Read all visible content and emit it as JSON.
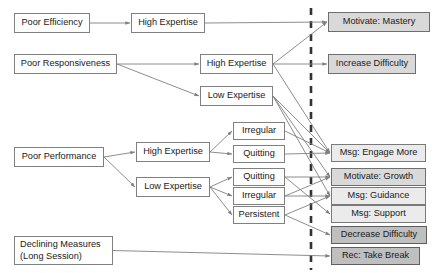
{
  "diagram": {
    "divider": {
      "name": "dashed-separator",
      "x": 311,
      "style": "dashed"
    },
    "nodes": [
      {
        "id": "poor-efficiency",
        "label": "Poor Efficiency",
        "x": 14,
        "y": 13,
        "w": 76,
        "h": 20,
        "fill": "white",
        "column": "condition"
      },
      {
        "id": "eff-high-expertise",
        "label": "High Expertise",
        "x": 131,
        "y": 13,
        "w": 74,
        "h": 20,
        "fill": "white",
        "column": "state"
      },
      {
        "id": "motivate-mastery",
        "label": "Motivate: Mastery",
        "x": 328,
        "y": 12,
        "w": 102,
        "h": 20,
        "fill": "mid",
        "column": "action"
      },
      {
        "id": "poor-responsiveness",
        "label": "Poor Responsiveness",
        "x": 14,
        "y": 54,
        "w": 103,
        "h": 20,
        "fill": "white",
        "column": "condition"
      },
      {
        "id": "resp-high-expertise",
        "label": "High Expertise",
        "x": 200,
        "y": 54,
        "w": 73,
        "h": 20,
        "fill": "white",
        "column": "state"
      },
      {
        "id": "resp-low-expertise",
        "label": "Low Expertise",
        "x": 200,
        "y": 86,
        "w": 73,
        "h": 20,
        "fill": "white",
        "column": "state"
      },
      {
        "id": "increase-difficulty",
        "label": "Increase Difficulty",
        "x": 328,
        "y": 54,
        "w": 88,
        "h": 20,
        "fill": "mid",
        "column": "action"
      },
      {
        "id": "poor-performance",
        "label": "Poor Performance",
        "x": 14,
        "y": 147,
        "w": 90,
        "h": 20,
        "fill": "white",
        "column": "condition"
      },
      {
        "id": "perf-high-expertise",
        "label": "High Expertise",
        "x": 136,
        "y": 142,
        "w": 74,
        "h": 20,
        "fill": "white",
        "column": "state"
      },
      {
        "id": "perf-low-expertise",
        "label": "Low Expertise",
        "x": 136,
        "y": 177,
        "w": 74,
        "h": 20,
        "fill": "white",
        "column": "state"
      },
      {
        "id": "hi-irregular",
        "label": "Irregular",
        "x": 233,
        "y": 122,
        "w": 52,
        "h": 18,
        "fill": "white",
        "column": "behavior"
      },
      {
        "id": "hi-quitting",
        "label": "Quitting",
        "x": 233,
        "y": 145,
        "w": 52,
        "h": 18,
        "fill": "white",
        "column": "behavior"
      },
      {
        "id": "lo-quitting",
        "label": "Quitting",
        "x": 233,
        "y": 168,
        "w": 52,
        "h": 18,
        "fill": "white",
        "column": "behavior"
      },
      {
        "id": "lo-irregular",
        "label": "Irregular",
        "x": 233,
        "y": 187,
        "w": 52,
        "h": 18,
        "fill": "white",
        "column": "behavior"
      },
      {
        "id": "lo-persistent",
        "label": "Persistent",
        "x": 233,
        "y": 206,
        "w": 52,
        "h": 18,
        "fill": "white",
        "column": "behavior"
      },
      {
        "id": "msg-engage-more",
        "label": "Msg: Engage More",
        "x": 331,
        "y": 144,
        "w": 95,
        "h": 18,
        "fill": "light",
        "column": "action"
      },
      {
        "id": "motivate-growth",
        "label": "Motivate: Growth",
        "x": 331,
        "y": 168,
        "w": 95,
        "h": 18,
        "fill": "mid",
        "column": "action"
      },
      {
        "id": "msg-guidance",
        "label": "Msg: Guidance",
        "x": 331,
        "y": 187,
        "w": 95,
        "h": 18,
        "fill": "light",
        "column": "action"
      },
      {
        "id": "msg-support",
        "label": "Msg: Support",
        "x": 331,
        "y": 205,
        "w": 95,
        "h": 18,
        "fill": "light",
        "column": "action"
      },
      {
        "id": "decrease-difficulty",
        "label": "Decrease Difficulty",
        "x": 331,
        "y": 226,
        "w": 96,
        "h": 18,
        "fill": "dark",
        "column": "action"
      },
      {
        "id": "rec-take-break",
        "label": "Rec: Take Break",
        "x": 331,
        "y": 247,
        "w": 89,
        "h": 18,
        "fill": "dark",
        "column": "action"
      },
      {
        "id": "declining-measures",
        "label": "Declining Measures\n(Long Session)",
        "x": 14,
        "y": 236,
        "w": 99,
        "h": 29,
        "fill": "white",
        "column": "condition"
      }
    ],
    "edges": [
      {
        "from": "poor-efficiency",
        "to": "eff-high-expertise"
      },
      {
        "from": "eff-high-expertise",
        "to": "motivate-mastery"
      },
      {
        "from": "poor-responsiveness",
        "to": "resp-high-expertise"
      },
      {
        "from": "poor-responsiveness",
        "to": "resp-low-expertise"
      },
      {
        "from": "resp-high-expertise",
        "to": "increase-difficulty"
      },
      {
        "from": "resp-high-expertise",
        "to": "motivate-mastery"
      },
      {
        "from": "resp-high-expertise",
        "to": "msg-engage-more"
      },
      {
        "from": "resp-low-expertise",
        "to": "msg-engage-more"
      },
      {
        "from": "resp-low-expertise",
        "to": "motivate-growth"
      },
      {
        "from": "resp-low-expertise",
        "to": "msg-guidance"
      },
      {
        "from": "poor-performance",
        "to": "perf-high-expertise"
      },
      {
        "from": "poor-performance",
        "to": "perf-low-expertise"
      },
      {
        "from": "perf-high-expertise",
        "to": "hi-irregular"
      },
      {
        "from": "perf-high-expertise",
        "to": "hi-quitting"
      },
      {
        "from": "perf-low-expertise",
        "to": "lo-quitting"
      },
      {
        "from": "perf-low-expertise",
        "to": "lo-irregular"
      },
      {
        "from": "perf-low-expertise",
        "to": "lo-persistent"
      },
      {
        "from": "hi-irregular",
        "to": "msg-engage-more"
      },
      {
        "from": "hi-quitting",
        "to": "msg-engage-more"
      },
      {
        "from": "lo-quitting",
        "to": "motivate-growth"
      },
      {
        "from": "lo-quitting",
        "to": "msg-support"
      },
      {
        "from": "lo-irregular",
        "to": "motivate-growth"
      },
      {
        "from": "lo-irregular",
        "to": "msg-guidance"
      },
      {
        "from": "lo-persistent",
        "to": "msg-guidance"
      },
      {
        "from": "lo-persistent",
        "to": "decrease-difficulty"
      },
      {
        "from": "declining-measures",
        "to": "rec-take-break"
      }
    ],
    "colors": {
      "line": "#808080",
      "box_border": "#808080",
      "text": "#1a1a1a",
      "fill_white": "#ffffff",
      "fill_light": "#ebebeb",
      "fill_mid": "#d9d9d9",
      "fill_dark": "#bfbfbf",
      "divider": "#333333"
    }
  }
}
